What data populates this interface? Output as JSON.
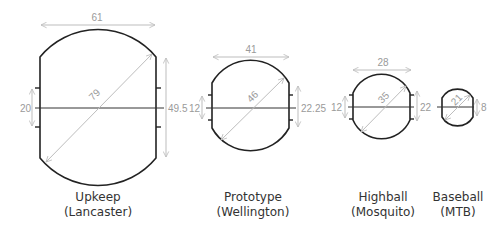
{
  "diagram": {
    "colors": {
      "outline": "#222222",
      "dimension_line": "#bdbdbd",
      "dimension_text": "#9a9a9a",
      "label_text": "#333333"
    },
    "bombs": [
      {
        "name": "Upkeep",
        "aircraft": "(Lancaster)",
        "dims": {
          "top": "61",
          "diagonal": "79",
          "left": "20",
          "right": "49.5"
        }
      },
      {
        "name": "Prototype",
        "aircraft": "(Wellington)",
        "dims": {
          "top": "41",
          "diagonal": "46",
          "left": "12",
          "right": "22.25"
        }
      },
      {
        "name": "Highball",
        "aircraft": "(Mosquito)",
        "dims": {
          "top": "28",
          "diagonal": "35",
          "left": "12",
          "right": "22"
        }
      },
      {
        "name": "Baseball",
        "aircraft": "(MTB)",
        "dims": {
          "diagonal": "21",
          "right": "8"
        }
      }
    ]
  }
}
